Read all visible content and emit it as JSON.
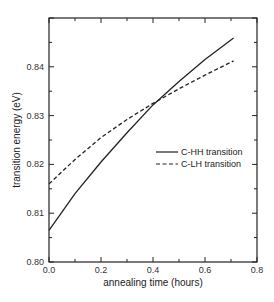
{
  "chart_data": {
    "type": "line",
    "title": "",
    "xlabel": "annealing time (hours)",
    "ylabel": "transition energy (eV)",
    "xlim": [
      0.0,
      0.8
    ],
    "ylim": [
      0.8,
      0.85
    ],
    "x_ticks": [
      "0.0",
      "0.2",
      "0.4",
      "0.6",
      "0.8"
    ],
    "y_ticks": [
      "0.80",
      "0.81",
      "0.82",
      "0.83",
      "0.84"
    ],
    "grid": false,
    "legend_position": "center-right",
    "series": [
      {
        "name": "C-HH transition",
        "style": "solid",
        "x": [
          0.0,
          0.1,
          0.2,
          0.3,
          0.4,
          0.5,
          0.6,
          0.71
        ],
        "y": [
          0.8065,
          0.814,
          0.8205,
          0.8265,
          0.8322,
          0.837,
          0.8415,
          0.8459
        ]
      },
      {
        "name": "C-LH transition",
        "style": "dashed",
        "x": [
          0.0,
          0.1,
          0.2,
          0.3,
          0.4,
          0.5,
          0.6,
          0.71
        ],
        "y": [
          0.816,
          0.821,
          0.8255,
          0.8292,
          0.8325,
          0.8355,
          0.8383,
          0.8412
        ]
      }
    ]
  }
}
